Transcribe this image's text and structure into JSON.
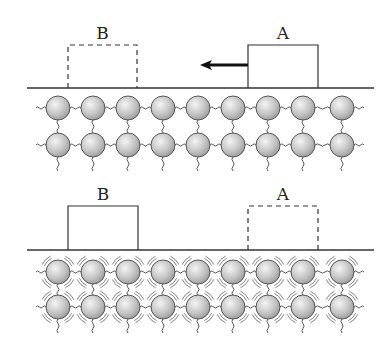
{
  "diagram": {
    "panels": [
      {
        "id": "top",
        "description": "Block A sliding left toward position B on a cold lattice surface",
        "baseline_y": 88,
        "blocks": [
          {
            "label": "B",
            "x": 68,
            "y": 45,
            "w": 69,
            "h": 43,
            "style": "dashed"
          },
          {
            "label": "A",
            "x": 248,
            "y": 45,
            "w": 70,
            "h": 43,
            "style": "solid"
          }
        ],
        "arrow": {
          "from_x": 248,
          "to_x": 200,
          "y": 65,
          "direction": "left"
        },
        "lattice": {
          "rows_y": [
            108,
            145
          ],
          "vibrating": false
        }
      },
      {
        "id": "bottom",
        "description": "Block B at rest after sliding; lattice atoms vibrating (heated)",
        "baseline_y": 250,
        "blocks": [
          {
            "label": "B",
            "x": 68,
            "y": 206,
            "w": 70,
            "h": 44,
            "style": "solid"
          },
          {
            "label": "A",
            "x": 248,
            "y": 206,
            "w": 70,
            "h": 44,
            "style": "dashed"
          }
        ],
        "lattice": {
          "rows_y": [
            272,
            307
          ],
          "vibrating": true
        }
      }
    ],
    "lattice_common": {
      "columns_x": [
        58,
        93,
        128,
        163,
        198,
        233,
        268,
        303,
        342
      ],
      "atom_radius": 12,
      "atom_fill": "#c8c8c8",
      "atom_stroke": "#555555"
    },
    "line_color": "#333333"
  }
}
